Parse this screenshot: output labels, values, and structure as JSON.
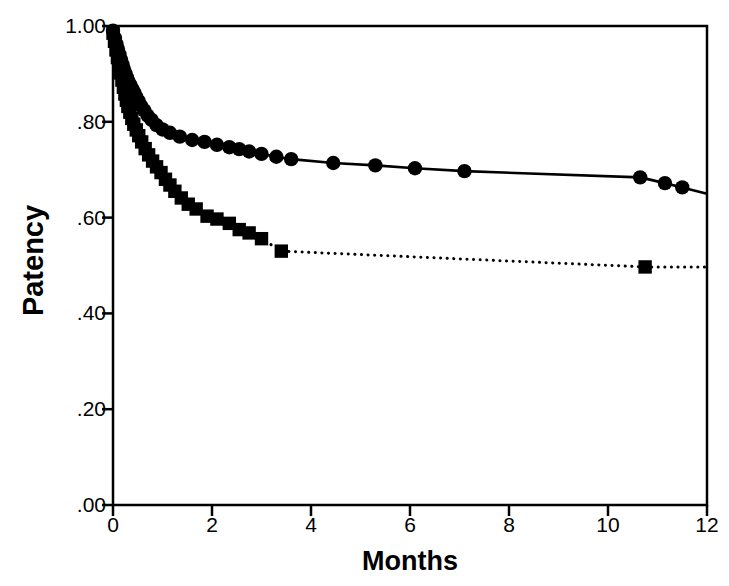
{
  "chart_data": {
    "type": "line",
    "title": "",
    "xlabel": "Months",
    "ylabel": "Patency",
    "xlim": [
      0,
      12
    ],
    "ylim": [
      0.0,
      1.0
    ],
    "grid": false,
    "legend": "none",
    "xticks": [
      "0",
      "2",
      "4",
      "6",
      "8",
      "10",
      "12"
    ],
    "xtick_values": [
      0,
      2,
      4,
      6,
      8,
      10,
      12
    ],
    "yticks": [
      "1.00",
      ".80",
      ".60",
      ".40",
      ".20",
      ".00"
    ],
    "ytick_values": [
      1.0,
      0.8,
      0.6,
      0.4,
      0.2,
      0.0
    ],
    "series": [
      {
        "name": "circle-series",
        "marker": "circle",
        "linestyle": "solid",
        "color": "#000000",
        "points": [
          [
            0.0,
            0.99
          ],
          [
            0.04,
            0.975
          ],
          [
            0.07,
            0.963
          ],
          [
            0.1,
            0.952
          ],
          [
            0.13,
            0.941
          ],
          [
            0.16,
            0.93
          ],
          [
            0.19,
            0.92
          ],
          [
            0.22,
            0.91
          ],
          [
            0.25,
            0.901
          ],
          [
            0.28,
            0.893
          ],
          [
            0.31,
            0.885
          ],
          [
            0.35,
            0.877
          ],
          [
            0.39,
            0.869
          ],
          [
            0.43,
            0.861
          ],
          [
            0.47,
            0.852
          ],
          [
            0.52,
            0.843
          ],
          [
            0.57,
            0.833
          ],
          [
            0.63,
            0.824
          ],
          [
            0.7,
            0.813
          ],
          [
            0.78,
            0.804
          ],
          [
            0.88,
            0.793
          ],
          [
            1.0,
            0.784
          ],
          [
            1.15,
            0.777
          ],
          [
            1.35,
            0.769
          ],
          [
            1.6,
            0.762
          ],
          [
            1.85,
            0.758
          ],
          [
            2.1,
            0.752
          ],
          [
            2.35,
            0.747
          ],
          [
            2.55,
            0.743
          ],
          [
            2.75,
            0.738
          ],
          [
            3.0,
            0.733
          ],
          [
            3.3,
            0.727
          ],
          [
            3.6,
            0.722
          ],
          [
            4.45,
            0.714
          ],
          [
            5.3,
            0.709
          ],
          [
            6.1,
            0.703
          ],
          [
            7.1,
            0.697
          ],
          [
            10.65,
            0.684
          ],
          [
            11.15,
            0.672
          ],
          [
            11.5,
            0.663
          ],
          [
            12.0,
            0.65
          ]
        ]
      },
      {
        "name": "square-series",
        "marker": "square",
        "linestyle": "dotted",
        "color": "#000000",
        "points": [
          [
            0.0,
            0.985
          ],
          [
            0.03,
            0.968
          ],
          [
            0.06,
            0.95
          ],
          [
            0.09,
            0.934
          ],
          [
            0.12,
            0.918
          ],
          [
            0.15,
            0.902
          ],
          [
            0.18,
            0.887
          ],
          [
            0.21,
            0.872
          ],
          [
            0.24,
            0.858
          ],
          [
            0.27,
            0.845
          ],
          [
            0.3,
            0.832
          ],
          [
            0.34,
            0.82
          ],
          [
            0.38,
            0.807
          ],
          [
            0.42,
            0.795
          ],
          [
            0.47,
            0.783
          ],
          [
            0.52,
            0.771
          ],
          [
            0.58,
            0.758
          ],
          [
            0.65,
            0.744
          ],
          [
            0.72,
            0.731
          ],
          [
            0.8,
            0.718
          ],
          [
            0.88,
            0.706
          ],
          [
            0.97,
            0.694
          ],
          [
            1.06,
            0.68
          ],
          [
            1.15,
            0.668
          ],
          [
            1.25,
            0.655
          ],
          [
            1.38,
            0.641
          ],
          [
            1.52,
            0.628
          ],
          [
            1.68,
            0.618
          ],
          [
            1.9,
            0.603
          ],
          [
            2.1,
            0.597
          ],
          [
            2.35,
            0.588
          ],
          [
            2.55,
            0.575
          ],
          [
            2.75,
            0.568
          ],
          [
            3.0,
            0.556
          ],
          [
            3.4,
            0.53
          ],
          [
            10.75,
            0.497
          ],
          [
            12.0,
            0.497
          ]
        ]
      }
    ]
  },
  "axes": {
    "frame_color": "#000000"
  }
}
